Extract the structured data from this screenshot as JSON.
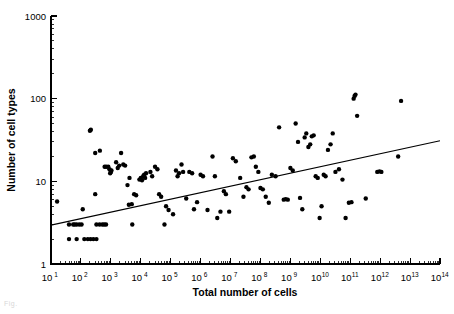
{
  "figure": {
    "caption_fragment": "Fig.",
    "background_color": "#ffffff",
    "ink_color": "#000000"
  },
  "chart_data": {
    "type": "scatter",
    "title": "",
    "xlabel": "Total number of cells",
    "ylabel": "Number of cell types",
    "xscale": "log",
    "yscale": "log",
    "xlim": [
      10,
      100000000000000
    ],
    "ylim": [
      1,
      1000
    ],
    "grid": false,
    "legend": null,
    "xtick_labels": [
      "10",
      "10",
      "10",
      "10",
      "10",
      "10",
      "10",
      "10",
      "10",
      "10",
      "10",
      "10",
      "10",
      "10"
    ],
    "xtick_exponents": [
      "1",
      "2",
      "3",
      "4",
      "5",
      "6",
      "7",
      "8",
      "9",
      "10",
      "11",
      "12",
      "13",
      "14"
    ],
    "xtick_values": [
      10,
      100,
      1000,
      10000,
      100000,
      1000000,
      10000000,
      100000000,
      1000000000,
      10000000000,
      100000000000,
      1000000000000,
      10000000000000,
      100000000000000
    ],
    "ytick_labels": [
      "1",
      "10",
      "100",
      "1000"
    ],
    "ytick_values": [
      1,
      10,
      100,
      1000
    ],
    "minor_ticks": true,
    "marker": "filled-circle",
    "marker_size_px": 3.4,
    "trendline": {
      "type": "linear-in-log-log",
      "x_start": 10,
      "y_start": 2.95,
      "x_end": 100000000000000,
      "y_end": 31.0
    },
    "points": [
      [
        16,
        5.7
      ],
      [
        40,
        3.0
      ],
      [
        55,
        3.0
      ],
      [
        62,
        3.0
      ],
      [
        72,
        3.0
      ],
      [
        88,
        3.0
      ],
      [
        105,
        3.0
      ],
      [
        40,
        2.0
      ],
      [
        72,
        2.0
      ],
      [
        130,
        2.0
      ],
      [
        170,
        2.0
      ],
      [
        210,
        2.0
      ],
      [
        260,
        2.0
      ],
      [
        330,
        2.0
      ],
      [
        115,
        4.6
      ],
      [
        200,
        41.0
      ],
      [
        215,
        42.0
      ],
      [
        300,
        22.0
      ],
      [
        430,
        23.5
      ],
      [
        300,
        7.0
      ],
      [
        330,
        3.0
      ],
      [
        420,
        3.0
      ],
      [
        520,
        3.0
      ],
      [
        600,
        3.0
      ],
      [
        690,
        3.0
      ],
      [
        620,
        15.0
      ],
      [
        700,
        15.0
      ],
      [
        820,
        15.0
      ],
      [
        900,
        14.0
      ],
      [
        950,
        12.5
      ],
      [
        1000,
        13.0
      ],
      [
        1050,
        13.5
      ],
      [
        1500,
        17.0
      ],
      [
        1700,
        14.5
      ],
      [
        1900,
        15.5
      ],
      [
        2200,
        22.0
      ],
      [
        2600,
        16.0
      ],
      [
        3000,
        15.5
      ],
      [
        3600,
        9.0
      ],
      [
        4200,
        11.0
      ],
      [
        5200,
        3.0
      ],
      [
        4000,
        5.2
      ],
      [
        5000,
        5.3
      ],
      [
        6000,
        7.0
      ],
      [
        7000,
        6.8
      ],
      [
        9000,
        10.5
      ],
      [
        10000,
        11.0
      ],
      [
        11000,
        10.3
      ],
      [
        12000,
        11.5
      ],
      [
        13000,
        12.0
      ],
      [
        14000,
        11.0
      ],
      [
        15000,
        12.5
      ],
      [
        21000,
        13.0
      ],
      [
        24000,
        11.5
      ],
      [
        30000,
        15.0
      ],
      [
        36000,
        14.0
      ],
      [
        41000,
        7.0
      ],
      [
        48000,
        6.5
      ],
      [
        62000,
        3.0
      ],
      [
        70000,
        5.0
      ],
      [
        85000,
        4.5
      ],
      [
        120000,
        4.0
      ],
      [
        150000,
        13.5
      ],
      [
        170000,
        11.5
      ],
      [
        190000,
        12.5
      ],
      [
        230000,
        16.0
      ],
      [
        260000,
        13.0
      ],
      [
        330000,
        6.2
      ],
      [
        420000,
        13.0
      ],
      [
        520000,
        12.5
      ],
      [
        600000,
        4.6
      ],
      [
        760000,
        5.6
      ],
      [
        1000000,
        12.0
      ],
      [
        1200000,
        11.5
      ],
      [
        1700000,
        4.5
      ],
      [
        2500000,
        20.0
      ],
      [
        3000000,
        11.5
      ],
      [
        3600000,
        3.6
      ],
      [
        4600000,
        4.3
      ],
      [
        6000000,
        7.6
      ],
      [
        7000000,
        7.0
      ],
      [
        9000000,
        4.3
      ],
      [
        12000000,
        19.0
      ],
      [
        15000000,
        17.5
      ],
      [
        21000000,
        11.0
      ],
      [
        27000000,
        6.5
      ],
      [
        34000000,
        8.5
      ],
      [
        40000000,
        8.0
      ],
      [
        50000000,
        19.5
      ],
      [
        60000000,
        20.0
      ],
      [
        70000000,
        15.0
      ],
      [
        85000000,
        13.0
      ],
      [
        100000000,
        8.3
      ],
      [
        120000000,
        8.0
      ],
      [
        150000000,
        6.5
      ],
      [
        190000000,
        5.5
      ],
      [
        240000000,
        12.0
      ],
      [
        320000000,
        11.5
      ],
      [
        420000000,
        45.0
      ],
      [
        600000000,
        6.0
      ],
      [
        700000000,
        6.1
      ],
      [
        820000000,
        6.0
      ],
      [
        1000000000,
        14.5
      ],
      [
        1200000000,
        13.5
      ],
      [
        1500000000,
        50.0
      ],
      [
        1800000000,
        30.0
      ],
      [
        2100000000,
        6.3
      ],
      [
        2500000000,
        4.6
      ],
      [
        3000000000,
        34.0
      ],
      [
        3400000000,
        38.0
      ],
      [
        4000000000,
        26.0
      ],
      [
        4600000000,
        28.0
      ],
      [
        5200000000,
        35.0
      ],
      [
        6000000000,
        36.0
      ],
      [
        7000000000,
        11.5
      ],
      [
        8200000000,
        11.0
      ],
      [
        9500000000,
        3.6
      ],
      [
        11000000000,
        5.0
      ],
      [
        13000000000,
        12.0
      ],
      [
        15000000000,
        11.5
      ],
      [
        18000000000,
        24.0
      ],
      [
        22000000000,
        28.0
      ],
      [
        26000000000,
        38.0
      ],
      [
        32000000000,
        13.0
      ],
      [
        42000000000,
        14.0
      ],
      [
        55000000000,
        10.5
      ],
      [
        70000000000,
        3.6
      ],
      [
        90000000000,
        5.5
      ],
      [
        110000000000,
        5.6
      ],
      [
        130000000000,
        100.0
      ],
      [
        140000000000,
        108.0
      ],
      [
        150000000000,
        112.0
      ],
      [
        170000000000,
        62.0
      ],
      [
        330000000000,
        6.2
      ],
      [
        800000000000,
        13.0
      ],
      [
        950000000000,
        13.2
      ],
      [
        1100000000000,
        13.0
      ],
      [
        4000000000000,
        20.0
      ],
      [
        5000000000000,
        94.0
      ]
    ]
  }
}
